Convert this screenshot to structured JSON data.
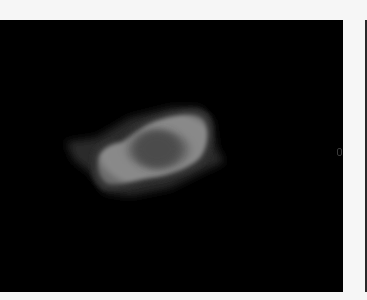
{
  "image": {
    "description": "Grayscale image of a bright irregular blob with a darker central core on a black background",
    "background_color": "#000000",
    "frame_color": "#f6f6f6",
    "blob": {
      "outer_halo_color": "#2e2e2e",
      "body_color": "#8a8a8a",
      "core_color": "#4a4a4a",
      "rim_color": "#3a3a3a"
    }
  }
}
